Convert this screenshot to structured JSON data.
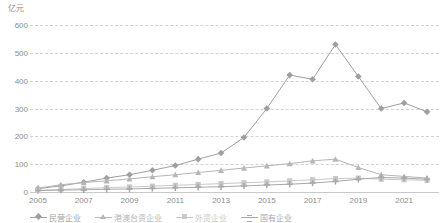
{
  "chart_data": {
    "type": "line",
    "title": "",
    "subtitle": "",
    "unit_label": "亿元",
    "xlabel": "",
    "ylabel": "",
    "ylim": [
      0,
      600
    ],
    "ytick_labels": [
      "600",
      "500",
      "400",
      "300",
      "200",
      "100",
      "0"
    ],
    "ytick_values": [
      600,
      500,
      400,
      300,
      200,
      100,
      0
    ],
    "grid": true,
    "grid_style": "dashed horizontal",
    "legend_position": "bottom",
    "x": [
      2005,
      2006,
      2007,
      2008,
      2009,
      2010,
      2011,
      2012,
      2013,
      2014,
      2015,
      2016,
      2017,
      2018,
      2019,
      2020,
      2021,
      2022
    ],
    "xtick_labels": [
      "2005",
      "2007",
      "2009",
      "2011",
      "2013",
      "2015",
      "2017",
      "2019",
      "2021"
    ],
    "xtick_values": [
      2005,
      2007,
      2009,
      2011,
      2013,
      2015,
      2017,
      2019,
      2021
    ],
    "series": [
      {
        "name": "民营企业",
        "color": "#9f9f9f",
        "marker": "diamond",
        "values": [
          12,
          22,
          35,
          50,
          62,
          78,
          95,
          118,
          140,
          196,
          300,
          420,
          405,
          530,
          415,
          300,
          320,
          288
        ]
      },
      {
        "name": "港澳台资企业",
        "color": "#b6b6b6",
        "marker": "triangle",
        "values": [
          14,
          26,
          34,
          40,
          47,
          55,
          62,
          70,
          78,
          86,
          94,
          102,
          112,
          118,
          88,
          62,
          56,
          50
        ]
      },
      {
        "name": "外资企业",
        "color": "#c9c9c9",
        "marker": "square",
        "values": [
          6,
          9,
          12,
          16,
          18,
          21,
          24,
          27,
          30,
          33,
          36,
          40,
          44,
          48,
          50,
          46,
          44,
          42
        ]
      },
      {
        "name": "国有企业",
        "color": "#a8a8a8",
        "marker": "cross",
        "values": [
          5,
          7,
          8,
          10,
          11,
          13,
          15,
          17,
          19,
          22,
          25,
          28,
          32,
          38,
          46,
          52,
          50,
          46
        ]
      }
    ]
  }
}
